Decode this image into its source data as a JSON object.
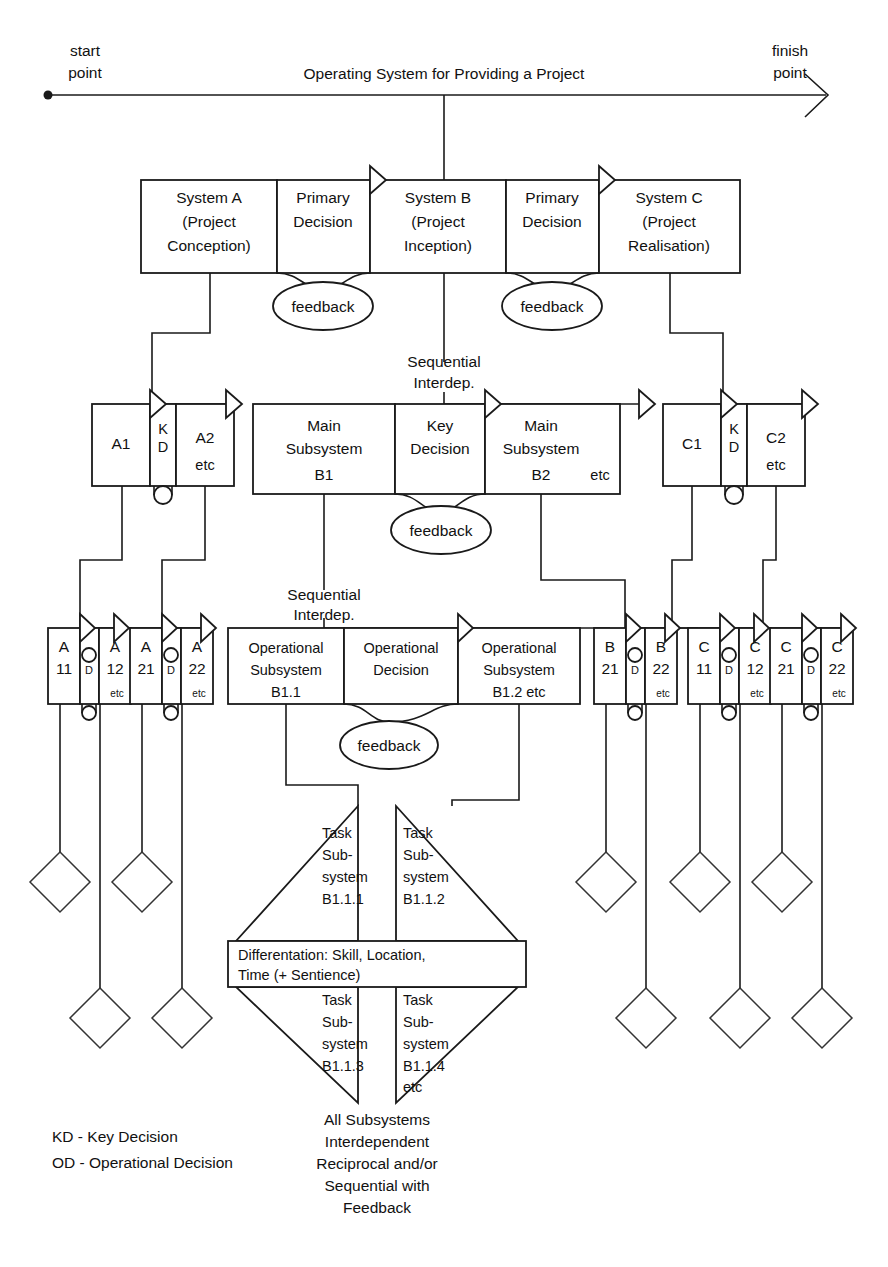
{
  "diagram": {
    "title": "Operating System for Providing a Project",
    "axis": {
      "start_label_line1": "start",
      "start_label_line2": "point",
      "finish_label_line1": "finish",
      "finish_label_line2": "point"
    },
    "row1": {
      "boxes": [
        {
          "id": "system-a",
          "line1": "System A",
          "line2": "(Project",
          "line3": "Conception)"
        },
        {
          "id": "primary-decision-1",
          "line1": "Primary",
          "line2": "Decision",
          "line3": ""
        },
        {
          "id": "system-b",
          "line1": "System B",
          "line2": "(Project",
          "line3": "Inception)"
        },
        {
          "id": "primary-decision-2",
          "line1": "Primary",
          "line2": "Decision",
          "line3": ""
        },
        {
          "id": "system-c",
          "line1": "System C",
          "line2": "(Project",
          "line3": "Realisation)"
        }
      ],
      "feedback_left": "feedback",
      "feedback_right": "feedback"
    },
    "row2": {
      "seq_label_line1": "Sequential",
      "seq_label_line2": "Interdep.",
      "a_group": {
        "left": "A1",
        "decision_l1": "K",
        "decision_l2": "D",
        "right": "A2",
        "right_etc": "etc"
      },
      "b_group": {
        "left_l1": "Main",
        "left_l2": "Subsystem",
        "left_l3": "B1",
        "decision_l1": "Key",
        "decision_l2": "Decision",
        "right_l1": "Main",
        "right_l2": "Subsystem",
        "right_l3": "B2",
        "right_etc": "etc"
      },
      "c_group": {
        "left": "C1",
        "decision_l1": "K",
        "decision_l2": "D",
        "right": "C2",
        "right_etc": "etc"
      },
      "feedback": "feedback"
    },
    "row3": {
      "seq_label_line1": "Sequential",
      "seq_label_line2": "Interdep.",
      "small_groups": [
        {
          "id": "a11-a12",
          "l1": "A",
          "l2": "11",
          "d1": "O",
          "d2": "D",
          "r1": "A",
          "r2": "12",
          "etc": "etc"
        },
        {
          "id": "a21-a22",
          "l1": "A",
          "l2": "21",
          "d1": "O",
          "d2": "D",
          "r1": "A",
          "r2": "22",
          "etc": "etc"
        },
        {
          "id": "b21-b22",
          "l1": "B",
          "l2": "21",
          "d1": "O",
          "d2": "D",
          "r1": "B",
          "r2": "22",
          "etc": "etc"
        },
        {
          "id": "c11-c12",
          "l1": "C",
          "l2": "11",
          "d1": "O",
          "d2": "D",
          "r1": "C",
          "r2": "12",
          "etc": "etc"
        },
        {
          "id": "c21-c22",
          "l1": "C",
          "l2": "21",
          "d1": "O",
          "d2": "D",
          "r1": "C",
          "r2": "22",
          "etc": "etc"
        }
      ],
      "b_group": {
        "left_l1": "Operational",
        "left_l2": "Subsystem",
        "left_l3": "B1.1",
        "decision_l1": "Operational",
        "decision_l2": "Decision",
        "right_l1": "Operational",
        "right_l2": "Subsystem",
        "right_l3": "B1.2 etc"
      },
      "feedback": "feedback"
    },
    "diamond_cluster": {
      "q_top_left": {
        "l1": "Task",
        "l2": "Sub-",
        "l3": "system",
        "l4": "B1.1.1"
      },
      "q_top_right": {
        "l1": "Task",
        "l2": "Sub-",
        "l3": "system",
        "l4": "B1.1.2"
      },
      "q_bottom_left": {
        "l1": "Task",
        "l2": "Sub-",
        "l3": "system",
        "l4": "B1.1.3"
      },
      "q_bottom_right": {
        "l1": "Task",
        "l2": "Sub-",
        "l3": "system",
        "l4": "B1.1.4",
        "l5": "etc"
      },
      "band_l1": "Differentation: Skill, Location,",
      "band_l2": "Time (+ Sentience)"
    },
    "caption": {
      "l1": "All Subsystems",
      "l2": "Interdependent",
      "l3": "Reciprocal and/or",
      "l4": "Sequential with",
      "l5": "Feedback"
    },
    "legend": {
      "kd": "KD - Key Decision",
      "od": "OD - Operational Decision"
    },
    "colors": {
      "stroke": "#1a1a1a",
      "background": "#ffffff",
      "text": "#111111"
    }
  }
}
